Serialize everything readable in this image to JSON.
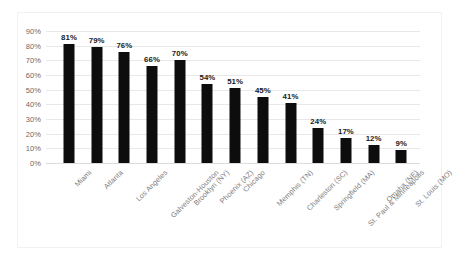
{
  "chart_data": {
    "type": "bar",
    "title": "",
    "subtitle": "",
    "xlabel": "",
    "ylabel": "",
    "ylim": [
      0,
      90
    ],
    "ytick_step": 10,
    "ytick_labels": [
      "90%",
      "80%",
      "70%",
      "60%",
      "50%",
      "40%",
      "30%",
      "20%",
      "10%",
      "0%"
    ],
    "grid": true,
    "legend": null,
    "orientation": "vertical",
    "bar_color": "#0d0d0d",
    "gridline_color": "#e8e8e8",
    "label_color": "#7d7d7d",
    "categories": [
      "Miami",
      "Atlanta",
      "Los Angeles",
      "Galveston-Houston",
      "Brooklyn (NY)",
      "Phoenix (AZ)",
      "Chicago",
      "Memphis (TN)",
      "Charleston (SC)",
      "Springfield (MA)",
      "St. Paul & Minneapolis",
      "Omaha (NE)",
      "St. Louis (MO)"
    ],
    "values": [
      81,
      79,
      76,
      66,
      70,
      54,
      51,
      45,
      41,
      24,
      17,
      12,
      9
    ],
    "value_labels": [
      "81%",
      "79%",
      "76%",
      "66%",
      "70%",
      "54%",
      "51%",
      "45%",
      "41%",
      "24%",
      "17%",
      "12%",
      "9%"
    ]
  }
}
